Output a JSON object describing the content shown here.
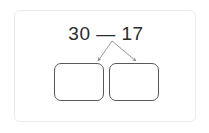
{
  "card": {
    "name": "math-subtraction-decomposition-card",
    "background_color": "#ffffff",
    "border_color": "#ebebeb"
  },
  "problem": {
    "expression": "30 — 17",
    "minuend": "30",
    "operator": "—",
    "subtrahend": "17",
    "text_color": "#2b2b2b"
  },
  "arrows": {
    "count": 2,
    "color": "#8a8a8a",
    "left_arrow_name": "branch-arrow-left",
    "right_arrow_name": "branch-arrow-right"
  },
  "answer_boxes": [
    {
      "label": "",
      "placeholder": "",
      "border_color": "#58585a"
    },
    {
      "label": "",
      "placeholder": "",
      "border_color": "#58585a"
    }
  ]
}
